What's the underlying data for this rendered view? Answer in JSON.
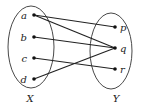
{
  "diagram": {
    "type": "function-mapping",
    "sets": [
      {
        "id": "X",
        "label": "X",
        "cx": 31,
        "cy": 47,
        "rx": 23,
        "ry": 41,
        "label_x": 30,
        "label_y": 102
      },
      {
        "id": "Y",
        "label": "Y",
        "cx": 111,
        "cy": 51,
        "rx": 21,
        "ry": 38,
        "label_x": 116,
        "label_y": 102
      }
    ],
    "elements": {
      "X": [
        {
          "id": "a",
          "label": "a",
          "x": 34,
          "y": 15
        },
        {
          "id": "b",
          "label": "b",
          "x": 34,
          "y": 37
        },
        {
          "id": "c",
          "label": "c",
          "x": 34,
          "y": 58
        },
        {
          "id": "d",
          "label": "d",
          "x": 34,
          "y": 79
        }
      ],
      "Y": [
        {
          "id": "p",
          "label": "p",
          "x": 115,
          "y": 27
        },
        {
          "id": "q",
          "label": "q",
          "x": 115,
          "y": 48
        },
        {
          "id": "r",
          "label": "r",
          "x": 115,
          "y": 69
        }
      ]
    },
    "mappings": [
      {
        "from": "a",
        "to": "p"
      },
      {
        "from": "a",
        "to": "q"
      },
      {
        "from": "b",
        "to": "q"
      },
      {
        "from": "c",
        "to": "r"
      },
      {
        "from": "d",
        "to": "q"
      }
    ]
  }
}
